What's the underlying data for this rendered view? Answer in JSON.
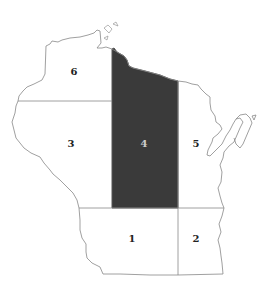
{
  "map": {
    "title": "",
    "regions": [
      {
        "id": "1",
        "label": "1",
        "shaded": false
      },
      {
        "id": "2",
        "label": "2",
        "shaded": false
      },
      {
        "id": "3",
        "label": "3",
        "shaded": false
      },
      {
        "id": "4",
        "label": "4",
        "shaded": true
      },
      {
        "id": "5",
        "label": "5",
        "shaded": false
      },
      {
        "id": "6",
        "label": "6",
        "shaded": false
      }
    ],
    "colors": {
      "shaded": "#3a3a3a",
      "outline": "#888888",
      "background": "#ffffff"
    }
  }
}
